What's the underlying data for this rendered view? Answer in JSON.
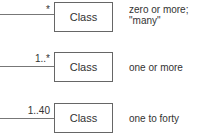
{
  "rows": [
    {
      "multiplicity": "*",
      "class_label": "Class",
      "description_line1": "zero or more;",
      "description_line2": "\"many\""
    },
    {
      "multiplicity": "1..*",
      "class_label": "Class",
      "description_line1": "one or more",
      "description_line2": ""
    },
    {
      "multiplicity": "1..40",
      "class_label": "Class",
      "description_line1": "one to forty",
      "description_line2": ""
    }
  ]
}
